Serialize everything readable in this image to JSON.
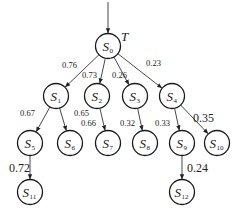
{
  "diagram": {
    "type": "tree",
    "tree_label": "T",
    "entry_arrow": true,
    "nodes": [
      {
        "id": "S0",
        "letter": "S",
        "sub": "0"
      },
      {
        "id": "S1",
        "letter": "S",
        "sub": "1"
      },
      {
        "id": "S2",
        "letter": "S",
        "sub": "2"
      },
      {
        "id": "S3",
        "letter": "S",
        "sub": "3"
      },
      {
        "id": "S4",
        "letter": "S",
        "sub": "4"
      },
      {
        "id": "S5",
        "letter": "S",
        "sub": "5"
      },
      {
        "id": "S6",
        "letter": "S",
        "sub": "6"
      },
      {
        "id": "S7",
        "letter": "S",
        "sub": "7"
      },
      {
        "id": "S8",
        "letter": "S",
        "sub": "8"
      },
      {
        "id": "S9",
        "letter": "S",
        "sub": "9"
      },
      {
        "id": "S10",
        "letter": "S",
        "sub": "10"
      },
      {
        "id": "S11",
        "letter": "S",
        "sub": "11"
      },
      {
        "id": "S12",
        "letter": "S",
        "sub": "12"
      }
    ],
    "edges": [
      {
        "from": "S0",
        "to": "S1",
        "weight": "0.76"
      },
      {
        "from": "S0",
        "to": "S2",
        "weight": "0.73"
      },
      {
        "from": "S0",
        "to": "S3",
        "weight": "0.26"
      },
      {
        "from": "S0",
        "to": "S4",
        "weight": "0.23"
      },
      {
        "from": "S1",
        "to": "S5",
        "weight": "0.67"
      },
      {
        "from": "S1",
        "to": "S6",
        "weight": "0.65"
      },
      {
        "from": "S2",
        "to": "S7",
        "weight": "0.66"
      },
      {
        "from": "S3",
        "to": "S8",
        "weight": "0.32"
      },
      {
        "from": "S4",
        "to": "S9",
        "weight": "0.33"
      },
      {
        "from": "S4",
        "to": "S10",
        "weight": "0.35"
      },
      {
        "from": "S5",
        "to": "S11",
        "weight": "0.72"
      },
      {
        "from": "S9",
        "to": "S12",
        "weight": "0.24"
      }
    ]
  }
}
